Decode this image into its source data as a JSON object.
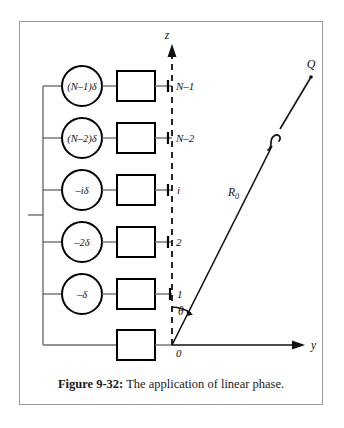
{
  "figure": {
    "caption_label": "Figure 9-32:",
    "caption_text": "The application of linear phase."
  },
  "diagram": {
    "type": "linear-phased-array-schematic",
    "axes": {
      "vertical_axis_label": "z",
      "horizontal_axis_label": "y",
      "origin_label": "0",
      "vertical_axis_style": "dashed-with-arrow",
      "horizontal_axis_style": "solid-with-arrow"
    },
    "ray": {
      "length_label": "R",
      "length_subscript": "0",
      "endpoint_label": "Q",
      "angle_label": "θ",
      "break_symbol": "≈"
    },
    "elements": [
      {
        "position_label": "N–1",
        "phase_label": "(N–1)δ",
        "has_phase_shifter": true
      },
      {
        "position_label": "N–2",
        "phase_label": "(N–2)δ",
        "has_phase_shifter": true
      },
      {
        "position_label": "i",
        "phase_label": "–iδ",
        "has_phase_shifter": true
      },
      {
        "position_label": "2",
        "phase_label": "–2δ",
        "has_phase_shifter": true
      },
      {
        "position_label": "1",
        "phase_label": "–δ",
        "has_phase_shifter": true
      },
      {
        "position_label": "0",
        "phase_label": "",
        "has_phase_shifter": false
      }
    ],
    "feed_network": {
      "description": "common feed bus with input stub"
    },
    "colors": {
      "frame_border": "#9a9a9a",
      "wire": "#6e6e6e",
      "component_outline": "#000000",
      "text": "#111111",
      "background": "#ffffff"
    }
  }
}
